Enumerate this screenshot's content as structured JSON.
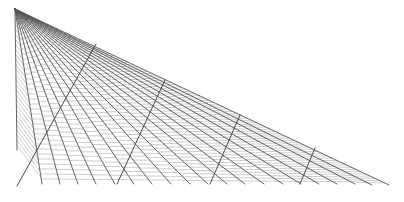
{
  "diagram": {
    "width": 404,
    "height": 202,
    "background": "#ffffff",
    "stroke_color": "#555555",
    "rung_color": "#9a9a9a",
    "apex": [
      15,
      9
    ],
    "ray_endpoints": [
      [
        17,
        150
      ],
      [
        42,
        184
      ],
      [
        60,
        184
      ],
      [
        78,
        184
      ],
      [
        96,
        184
      ],
      [
        115,
        184
      ],
      [
        134,
        184
      ],
      [
        152,
        184
      ],
      [
        171,
        184
      ],
      [
        190,
        184
      ],
      [
        208,
        184
      ],
      [
        227,
        184
      ],
      [
        245,
        184
      ],
      [
        264,
        184
      ],
      [
        283,
        184
      ],
      [
        301,
        184
      ],
      [
        319,
        184
      ],
      [
        337,
        184
      ],
      [
        355,
        184
      ],
      [
        372,
        185
      ],
      [
        389,
        185
      ]
    ],
    "rung_spacing": 5,
    "rung_length": 4,
    "spines": [
      {
        "from": [
          96,
          44
        ],
        "to": [
          17,
          186
        ]
      },
      {
        "from": [
          165,
          80
        ],
        "to": [
          117,
          184
        ]
      },
      {
        "from": [
          240,
          115
        ],
        "to": [
          210,
          184
        ]
      },
      {
        "from": [
          315,
          148
        ],
        "to": [
          300,
          184
        ]
      }
    ]
  }
}
